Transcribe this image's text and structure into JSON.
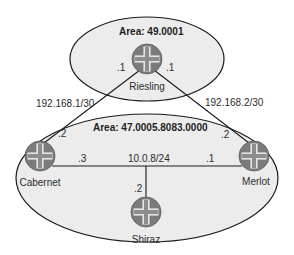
{
  "diagram": {
    "areas": [
      {
        "id": "area-49",
        "label": "Area: 49.0001"
      },
      {
        "id": "area-47",
        "label": "Area: 47.0005.8083.0000"
      }
    ],
    "routers": [
      {
        "name": "Riesling",
        "area": "Area: 49.0001"
      },
      {
        "name": "Cabernet",
        "area": "Area: 47.0005.8083.0000"
      },
      {
        "name": "Merlot",
        "area": "Area: 47.0005.8083.0000"
      },
      {
        "name": "Shiraz",
        "area": "Area: 47.0005.8083.0000"
      }
    ],
    "links": [
      {
        "from": "Riesling",
        "to": "Cabernet",
        "subnet": "192.168.1/30",
        "from_addr": ".1",
        "to_addr": ".2"
      },
      {
        "from": "Riesling",
        "to": "Merlot",
        "subnet": "192.168.2/30",
        "from_addr": ".1",
        "to_addr": ".2"
      },
      {
        "segment": "shared",
        "subnet": "10.0.8/24",
        "members": [
          {
            "router": "Cabernet",
            "addr": ".3"
          },
          {
            "router": "Merlot",
            "addr": ".1"
          },
          {
            "router": "Shiraz",
            "addr": ".2"
          }
        ]
      }
    ],
    "colors": {
      "area_fill": "#ececec",
      "outline": "#1a1a1a",
      "router_fill": "#7b7b7b",
      "router_cross": "#9a9a9a",
      "router_cross_edge": "#e4e4e4"
    }
  }
}
